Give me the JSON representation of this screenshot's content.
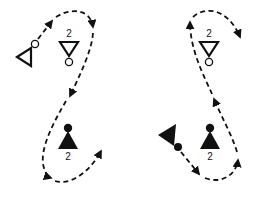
{
  "diagrams": [
    {
      "id": "left",
      "players": [
        {
          "name": "attacker-open-triangle",
          "label": ""
        },
        {
          "name": "defender-open-2",
          "label": "2"
        },
        {
          "name": "defender-filled-2",
          "label": "2"
        }
      ]
    },
    {
      "id": "right",
      "players": [
        {
          "name": "attacker-filled-triangle",
          "label": ""
        },
        {
          "name": "defender-open-2",
          "label": "2"
        },
        {
          "name": "defender-filled-2",
          "label": "2"
        }
      ]
    }
  ],
  "colors": {
    "ink": "#111111",
    "background": "#ffffff"
  }
}
